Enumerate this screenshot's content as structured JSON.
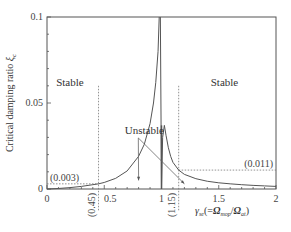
{
  "chart_data": {
    "type": "line",
    "title": "",
    "xlabel": "γ_se (= Ω_mop / Ω_at)",
    "xlabel_parts": {
      "main": "γ",
      "sub": "se",
      "open": "(=",
      "num": "Ω",
      "num_sub": "mop",
      "slash": "/",
      "den": "Ω",
      "den_sub": "at",
      "close": ")"
    },
    "ylabel": "Critical damping ratio ξ_c",
    "ylabel_parts": {
      "main": "Critical damping ratio ",
      "sym": "ξ",
      "sub": "c"
    },
    "xlim": [
      0,
      2
    ],
    "ylim": [
      0,
      0.1
    ],
    "x_ticks": [
      0,
      0.5,
      1,
      1.5,
      2
    ],
    "x_tick_labels": [
      "0",
      "0.5",
      "1",
      "1.5",
      "2"
    ],
    "y_ticks": [
      0,
      0.05,
      0.1
    ],
    "y_tick_labels": [
      "0",
      "0.05",
      "0.1"
    ],
    "grid": false,
    "series": [
      {
        "name": "critical damping ratio (lower branch)",
        "x": [
          0.0,
          0.1,
          0.2,
          0.3,
          0.4,
          0.45,
          0.5,
          0.6,
          0.7,
          0.8,
          0.85,
          0.9,
          0.93,
          0.95,
          0.97,
          0.98
        ],
        "y": [
          0.0,
          0.0003,
          0.0008,
          0.0015,
          0.0025,
          0.003,
          0.0038,
          0.0062,
          0.0105,
          0.019,
          0.026,
          0.038,
          0.05,
          0.062,
          0.08,
          0.1
        ]
      },
      {
        "name": "critical damping ratio (peak branch)",
        "x": [
          0.99,
          0.995,
          1.0
        ],
        "y": [
          0.1,
          0.05,
          0.0
        ]
      },
      {
        "name": "critical damping ratio (upper branch)",
        "x": [
          1.0,
          1.01,
          1.025,
          1.04,
          1.06,
          1.08,
          1.1,
          1.15,
          1.2,
          1.3,
          1.4,
          1.5,
          1.6,
          1.7,
          1.8,
          1.9,
          2.0
        ],
        "y": [
          0.0,
          0.03,
          0.037,
          0.031,
          0.024,
          0.019,
          0.0155,
          0.011,
          0.0085,
          0.006,
          0.0045,
          0.0036,
          0.003,
          0.0025,
          0.0021,
          0.0018,
          0.0015
        ]
      }
    ],
    "reference_lines": [
      {
        "type": "vertical",
        "x": 0.45,
        "y_range": [
          0,
          0.06
        ],
        "label": "(0.45)",
        "style": "dotted"
      },
      {
        "type": "vertical",
        "x": 1.15,
        "y_range": [
          0,
          0.06
        ],
        "label": "(1.15)",
        "style": "dotted"
      },
      {
        "type": "horizontal",
        "y": 0.003,
        "x_range": [
          0,
          0.45
        ],
        "label": "(0.003)",
        "style": "dotted"
      },
      {
        "type": "horizontal",
        "y": 0.011,
        "x_range": [
          1.15,
          2
        ],
        "label": "(0.011)",
        "style": "dotted"
      }
    ],
    "annotations": [
      {
        "text": "Stable",
        "x": 0.2,
        "y": 0.06
      },
      {
        "text": "Stable",
        "x": 1.55,
        "y": 0.06
      },
      {
        "text": "Unstable",
        "x": 0.85,
        "y": 0.032,
        "arrows_to": [
          [
            0.8,
            0.005
          ],
          [
            1.2,
            0.003
          ]
        ]
      }
    ]
  }
}
